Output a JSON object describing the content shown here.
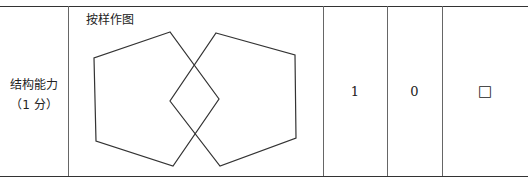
{
  "table": {
    "row_label_line1": "结构能力",
    "row_label_line2": "（1 分）",
    "figure_caption": "按样作图",
    "figure_description": "two-overlapping-pentagons",
    "score_max": "1",
    "score_zero": "0",
    "checkbox_symbol": "□"
  }
}
